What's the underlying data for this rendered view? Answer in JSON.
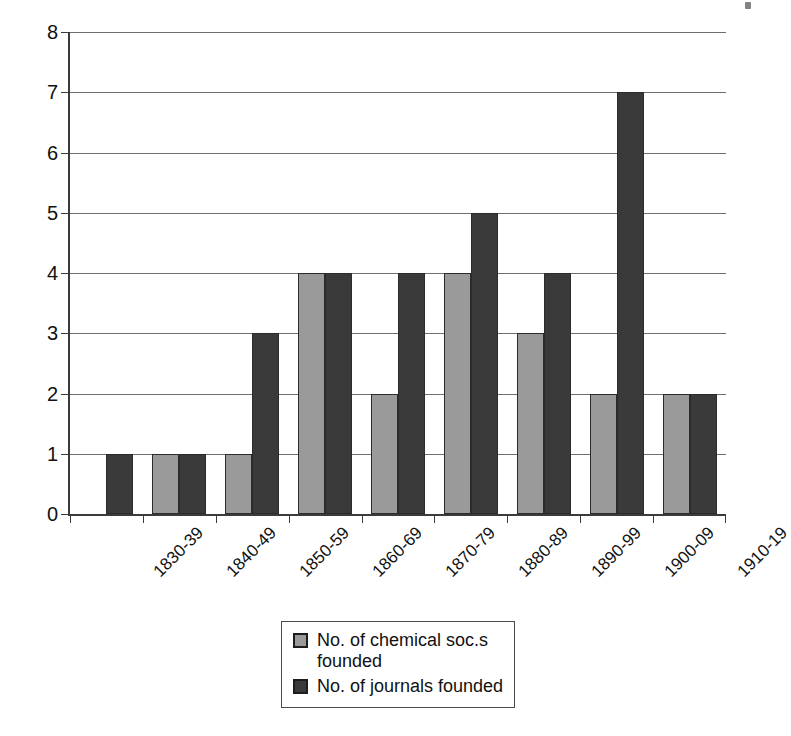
{
  "chart_data": {
    "type": "bar",
    "title": "",
    "subtitle": "",
    "xlabel": "",
    "ylabel": "",
    "ylim": [
      0,
      8
    ],
    "ytick_values": [
      0,
      1,
      2,
      3,
      4,
      5,
      6,
      7,
      8
    ],
    "ytick_labels": [
      "0",
      "1",
      "2",
      "3",
      "4",
      "5",
      "6",
      "7",
      "8"
    ],
    "grid": true,
    "grid_axis": "y",
    "legend_position": "bottom-center",
    "categories": [
      "1830-39",
      "1840-49",
      "1850-59",
      "1860-69",
      "1870-79",
      "1880-89",
      "1890-99",
      "1900-09",
      "1910-19"
    ],
    "series": [
      {
        "name": "No. of chemical soc.s founded",
        "color": "#9a9a9a",
        "values": [
          0,
          1,
          1,
          4,
          2,
          4,
          3,
          2,
          2
        ]
      },
      {
        "name": "No. of journals founded",
        "color": "#3a3a3a",
        "values": [
          1,
          1,
          3,
          4,
          4,
          5,
          4,
          7,
          2
        ]
      }
    ]
  },
  "legend": {
    "entries": [
      {
        "label_line1": "No. of chemical soc.s",
        "label_line2": "founded"
      },
      {
        "label_line1": "No. of journals founded",
        "label_line2": ""
      }
    ]
  },
  "colors": {
    "series_light": "#9a9a9a",
    "series_dark": "#3a3a3a",
    "axis": "#3b3b3b",
    "gridline": "#6f6f6f",
    "background": "#ffffff",
    "text": "#111111"
  }
}
